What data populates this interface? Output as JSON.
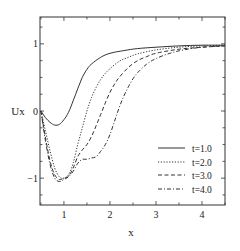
{
  "chart_data": {
    "type": "line",
    "title": "",
    "xlabel": "x",
    "ylabel": "Ux",
    "xlim": [
      0.48,
      4.5
    ],
    "ylim": [
      -1.4,
      1.4
    ],
    "xticks": [
      1,
      2,
      3,
      4
    ],
    "yticks": [
      -1,
      0,
      1
    ],
    "grid": false,
    "legend_position": "lower right",
    "series": [
      {
        "name": "t=1.0",
        "style": "solid",
        "x": [
          0.5,
          0.6,
          0.7,
          0.8,
          0.9,
          1.0,
          1.1,
          1.2,
          1.3,
          1.4,
          1.5,
          1.6,
          1.8,
          2.0,
          2.3,
          2.6,
          3.0,
          3.5,
          4.0,
          4.5
        ],
        "y": [
          0.0,
          -0.1,
          -0.17,
          -0.21,
          -0.2,
          -0.13,
          -0.02,
          0.15,
          0.33,
          0.5,
          0.62,
          0.7,
          0.8,
          0.86,
          0.9,
          0.93,
          0.95,
          0.97,
          0.98,
          0.98
        ]
      },
      {
        "name": "t=2.0",
        "style": "dotted",
        "x": [
          0.5,
          0.6,
          0.7,
          0.8,
          0.9,
          1.0,
          1.1,
          1.2,
          1.3,
          1.4,
          1.5,
          1.6,
          1.7,
          1.8,
          1.9,
          2.0,
          2.2,
          2.4,
          2.6,
          3.0,
          3.5,
          4.0,
          4.5
        ],
        "y": [
          0.0,
          -0.3,
          -0.6,
          -0.85,
          -0.98,
          -1.0,
          -0.95,
          -0.78,
          -0.5,
          -0.25,
          0.0,
          0.2,
          0.35,
          0.47,
          0.56,
          0.63,
          0.74,
          0.8,
          0.85,
          0.91,
          0.95,
          0.97,
          0.98
        ]
      },
      {
        "name": "t=3.0",
        "style": "dashed",
        "x": [
          0.5,
          0.6,
          0.7,
          0.8,
          0.9,
          1.0,
          1.1,
          1.2,
          1.3,
          1.4,
          1.5,
          1.6,
          1.7,
          1.8,
          1.9,
          2.0,
          2.1,
          2.2,
          2.4,
          2.6,
          2.8,
          3.0,
          3.5,
          4.0,
          4.5
        ],
        "y": [
          0.0,
          -0.4,
          -0.75,
          -0.95,
          -1.02,
          -1.0,
          -0.97,
          -0.85,
          -0.68,
          -0.58,
          -0.5,
          -0.38,
          -0.22,
          -0.05,
          0.12,
          0.28,
          0.4,
          0.5,
          0.65,
          0.75,
          0.81,
          0.86,
          0.92,
          0.95,
          0.97
        ]
      },
      {
        "name": "t=4.0",
        "style": "dashdot",
        "x": [
          0.5,
          0.6,
          0.7,
          0.8,
          0.9,
          1.0,
          1.1,
          1.2,
          1.3,
          1.4,
          1.5,
          1.6,
          1.7,
          1.8,
          1.9,
          2.0,
          2.1,
          2.2,
          2.3,
          2.4,
          2.5,
          2.6,
          2.8,
          3.0,
          3.3,
          3.6,
          4.0,
          4.5
        ],
        "y": [
          0.0,
          -0.45,
          -0.8,
          -1.0,
          -1.05,
          -1.02,
          -0.98,
          -0.9,
          -0.78,
          -0.72,
          -0.72,
          -0.7,
          -0.68,
          -0.6,
          -0.5,
          -0.35,
          -0.15,
          0.05,
          0.22,
          0.36,
          0.48,
          0.57,
          0.7,
          0.78,
          0.86,
          0.91,
          0.95,
          0.97
        ]
      }
    ]
  }
}
